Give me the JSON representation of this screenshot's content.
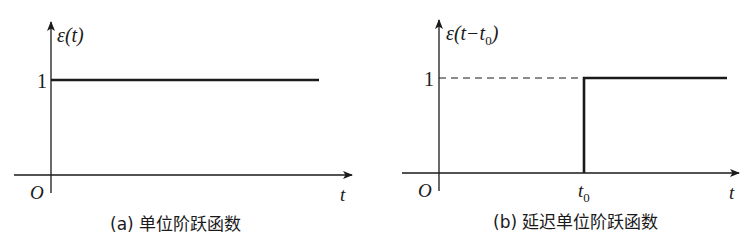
{
  "panel_a": {
    "y_label": "ε(t)",
    "level_label": "1",
    "origin_label": "O",
    "x_label": "t",
    "caption": "(a) 单位阶跃函数"
  },
  "panel_b": {
    "y_label_main": "ε(t−t",
    "y_label_sub": "0",
    "y_label_close": ")",
    "level_label": "1",
    "origin_label": "O",
    "step_label_main": "t",
    "step_label_sub": "0",
    "x_label": "t",
    "caption": "(b) 延迟单位阶跃函数"
  },
  "colors": {
    "line": "#1a1a1a",
    "background": "#ffffff"
  }
}
